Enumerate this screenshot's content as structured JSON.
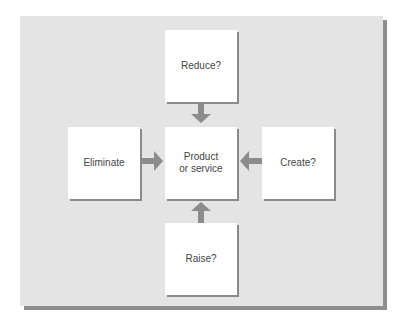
{
  "diagram": {
    "type": "four-actions-framework",
    "center": {
      "label": "Product\nor service"
    },
    "nodes": [
      {
        "id": "reduce",
        "label": "Reduce?",
        "position": "top"
      },
      {
        "id": "eliminate",
        "label": "Eliminate",
        "position": "left"
      },
      {
        "id": "create",
        "label": "Create?",
        "position": "right"
      },
      {
        "id": "raise",
        "label": "Raise?",
        "position": "bottom"
      }
    ],
    "edges": [
      {
        "from": "reduce",
        "to": "center",
        "direction": "down"
      },
      {
        "from": "eliminate",
        "to": "center",
        "direction": "right"
      },
      {
        "from": "create",
        "to": "center",
        "direction": "left"
      },
      {
        "from": "raise",
        "to": "center",
        "direction": "up"
      }
    ],
    "colors": {
      "panel_background": "#e4e4e4",
      "panel_shadow": "#8e8e8e",
      "box_fill": "#ffffff",
      "box_shadow": "#8a8a8a",
      "arrow": "#8c8c8c",
      "text": "#454545"
    }
  }
}
